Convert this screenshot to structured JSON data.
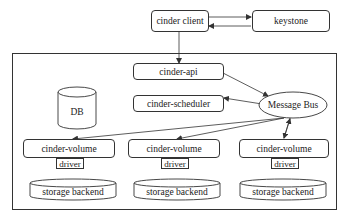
{
  "diagram": {
    "cinder_client": "cinder client",
    "keystone": "keystone",
    "cinder_api": "cinder-api",
    "cinder_scheduler": "cinder-scheduler",
    "db": "DB",
    "message_bus": "Message Bus",
    "volumes": [
      {
        "label": "cinder-volume",
        "driver": "driver",
        "backend": "storage backend"
      },
      {
        "label": "cinder-volume",
        "driver": "driver",
        "backend": "storage backend"
      },
      {
        "label": "cinder-volume",
        "driver": "driver",
        "backend": "storage backend"
      }
    ]
  },
  "colors": {
    "stroke": "#333333",
    "background": "#ffffff"
  }
}
